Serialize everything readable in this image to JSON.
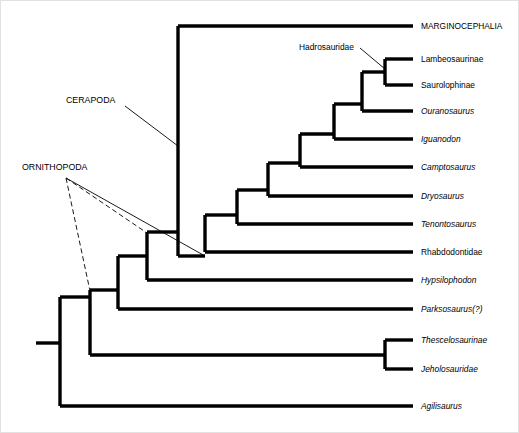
{
  "figure": {
    "background_color": "#ffffff",
    "line_color": "#000000",
    "border_color": "#e2e2e2"
  },
  "chart_data": {
    "type": "diagram",
    "diagram_kind": "cladogram",
    "tip_count": 13,
    "tips": [
      {
        "id": "marginocephalia",
        "label": "MARGINOCEPHALIA",
        "italic": false,
        "y": 26,
        "branch_x": 413,
        "label_x": 421
      },
      {
        "id": "lambeosaurinae",
        "label": "Lambeosaurinae",
        "italic": false,
        "y": 59,
        "branch_x": 413,
        "label_x": 421
      },
      {
        "id": "saurolophinae",
        "label": "Saurolophinae",
        "italic": false,
        "y": 85,
        "branch_x": 413,
        "label_x": 421
      },
      {
        "id": "ouranosaurus",
        "label": "Ouranosaurus",
        "italic": true,
        "y": 111,
        "branch_x": 413,
        "label_x": 421
      },
      {
        "id": "iguanodon",
        "label": "Iguanodon",
        "italic": true,
        "y": 139,
        "branch_x": 413,
        "label_x": 421
      },
      {
        "id": "camptosaurus",
        "label": "Camptosaurus",
        "italic": true,
        "y": 167,
        "branch_x": 413,
        "label_x": 421
      },
      {
        "id": "dryosaurus",
        "label": "Dryosaurus",
        "italic": true,
        "y": 196,
        "branch_x": 413,
        "label_x": 421
      },
      {
        "id": "tenontosaurus",
        "label": "Tenontosaurus",
        "italic": true,
        "y": 224,
        "branch_x": 413,
        "label_x": 421
      },
      {
        "id": "rhabdodontidae",
        "label": "Rhabdodontidae",
        "italic": false,
        "y": 252,
        "branch_x": 413,
        "label_x": 421
      },
      {
        "id": "hypsilophodon",
        "label": "Hypsilophodon",
        "italic": true,
        "y": 280,
        "branch_x": 413,
        "label_x": 421
      },
      {
        "id": "parksosaurus",
        "label": "Parksosaurus(?)",
        "italic": true,
        "y": 309,
        "branch_x": 413,
        "label_x": 421
      },
      {
        "id": "thescelosaurinae",
        "label": "Thescelosaurinae",
        "italic": true,
        "y": 340,
        "branch_x": 413,
        "label_x": 421
      },
      {
        "id": "jeholosauridae",
        "label": "Jeholosauridae",
        "italic": true,
        "y": 369,
        "branch_x": 413,
        "label_x": 421
      },
      {
        "id": "agilisaurus",
        "label": "Agilisaurus",
        "italic": true,
        "y": 406,
        "branch_x": 413,
        "label_x": 421
      }
    ],
    "nodes": [
      {
        "id": "root",
        "x": 60,
        "y_top": 297,
        "y_bottom": 406
      },
      {
        "id": "node-b",
        "x": 90,
        "y_top": 290,
        "y_bottom": 355
      },
      {
        "id": "node-c",
        "x": 118,
        "y_top": 256,
        "y_bottom": 309
      },
      {
        "id": "node-d",
        "x": 147,
        "y_top": 232,
        "y_bottom": 280
      },
      {
        "id": "node-e",
        "x": 178,
        "y_top": 26,
        "y_bottom": 256
      },
      {
        "id": "node-f",
        "x": 205,
        "y_top": 215,
        "y_bottom": 252
      },
      {
        "id": "node-g",
        "x": 237,
        "y_top": 190,
        "y_bottom": 224
      },
      {
        "id": "node-h",
        "x": 268,
        "y_top": 163,
        "y_bottom": 196
      },
      {
        "id": "node-i",
        "x": 300,
        "y_top": 134,
        "y_bottom": 167
      },
      {
        "id": "node-j",
        "x": 334,
        "y_top": 104,
        "y_bottom": 139
      },
      {
        "id": "node-k",
        "x": 362,
        "y_top": 72,
        "y_bottom": 111
      },
      {
        "id": "node-had",
        "x": 385,
        "y_top": 59,
        "y_bottom": 85
      },
      {
        "id": "node-thje",
        "x": 385,
        "y_top": 340,
        "y_bottom": 369
      }
    ],
    "root_stem": {
      "x1": 36,
      "x2": 60,
      "y": 343
    },
    "clade_labels": [
      {
        "id": "hadrosauridae",
        "label": "Hadrosauridae",
        "text_x": 299,
        "text_y": 50,
        "anchor": "start",
        "leaders": [
          {
            "style": "solid",
            "x1": 360,
            "y1": 48,
            "x2": 385,
            "y2": 69
          }
        ]
      },
      {
        "id": "cerapoda",
        "label": "CERAPODA",
        "text_x": 66,
        "text_y": 103,
        "anchor": "start",
        "leaders": [
          {
            "style": "solid",
            "x1": 125,
            "y1": 106,
            "x2": 178,
            "y2": 146
          }
        ]
      },
      {
        "id": "ornithopoda",
        "label": "ORNITHOPODA",
        "text_x": 22,
        "text_y": 170,
        "anchor": "start",
        "leaders": [
          {
            "style": "dashed",
            "x1": 66,
            "y1": 178,
            "x2": 90,
            "y2": 291
          },
          {
            "style": "dashed",
            "x1": 66,
            "y1": 178,
            "x2": 147,
            "y2": 233
          },
          {
            "style": "solid",
            "x1": 66,
            "y1": 178,
            "x2": 205,
            "y2": 256
          }
        ]
      }
    ]
  }
}
